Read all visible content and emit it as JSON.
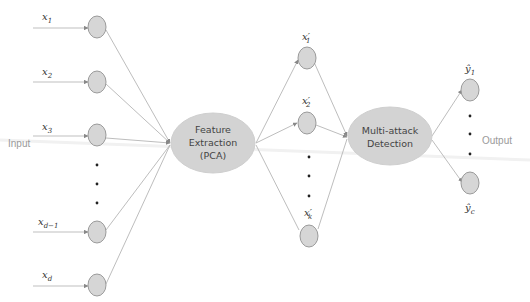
{
  "diagram": {
    "input_label": "Input",
    "output_label": "Output",
    "input_nodes": [
      {
        "label": "x",
        "sub": "1"
      },
      {
        "label": "x",
        "sub": "2"
      },
      {
        "label": "x",
        "sub": "3"
      },
      {
        "label": "x",
        "sub": "d−1"
      },
      {
        "label": "x",
        "sub": "d"
      }
    ],
    "feature_block": {
      "line1": "Feature",
      "line2": "Extraction",
      "line3": "(PCA)"
    },
    "feature_nodes": [
      {
        "label": "x′",
        "sub": "1"
      },
      {
        "label": "x′",
        "sub": "2"
      },
      {
        "label": "x′",
        "sub": "k"
      }
    ],
    "detection_block": {
      "line1": "Multi-attack",
      "line2": "Detection"
    },
    "output_nodes": [
      {
        "label": "ŷ",
        "sub": "1"
      },
      {
        "label": "ŷ",
        "sub": "c"
      }
    ],
    "colors": {
      "node_fill": "#d6d6d6",
      "node_stroke": "#9a9a9a",
      "edge": "#b5b5b5",
      "label_gray": "#9a9a9a"
    }
  }
}
